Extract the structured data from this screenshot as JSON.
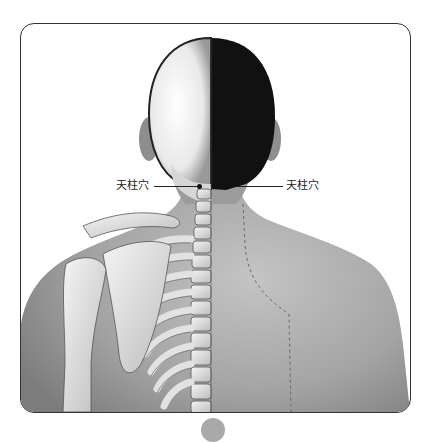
{
  "figure": {
    "labels": {
      "left_acupoint": "天柱穴",
      "right_acupoint": "天柱穴"
    },
    "colors": {
      "frame_border": "#333333",
      "skin": "#a6a6a6",
      "skull_light": "#f2f2f2",
      "hair_dark": "#111111",
      "bone": "#e8e8e8",
      "page_dot": "#a9a9a9"
    }
  }
}
